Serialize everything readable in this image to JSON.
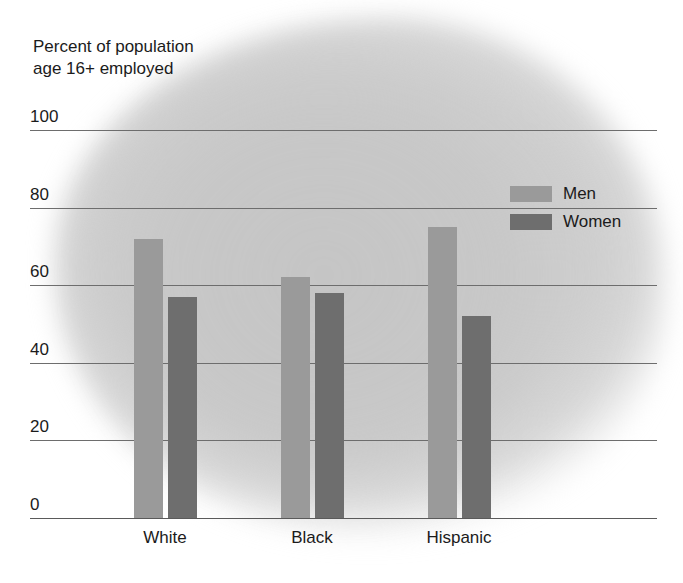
{
  "chart_data": {
    "type": "bar",
    "title": "Percent of population\nage 16+ employed",
    "ylabel": "Percent of population age 16+ employed",
    "xlabel": "",
    "categories": [
      "White",
      "Black",
      "Hispanic"
    ],
    "series": [
      {
        "name": "Men",
        "color": "#9a9a9a",
        "values": [
          72,
          62,
          75
        ]
      },
      {
        "name": "Women",
        "color": "#6e6e6e",
        "values": [
          57,
          58,
          52
        ]
      }
    ],
    "ylim": [
      0,
      100
    ],
    "yticks": [
      "0",
      "20",
      "40",
      "60",
      "80",
      "100"
    ],
    "grid": true,
    "legend_position": "top-right"
  },
  "legend": {
    "entries": [
      {
        "label": "Men",
        "color": "#9a9a9a"
      },
      {
        "label": "Women",
        "color": "#6e6e6e"
      }
    ]
  }
}
